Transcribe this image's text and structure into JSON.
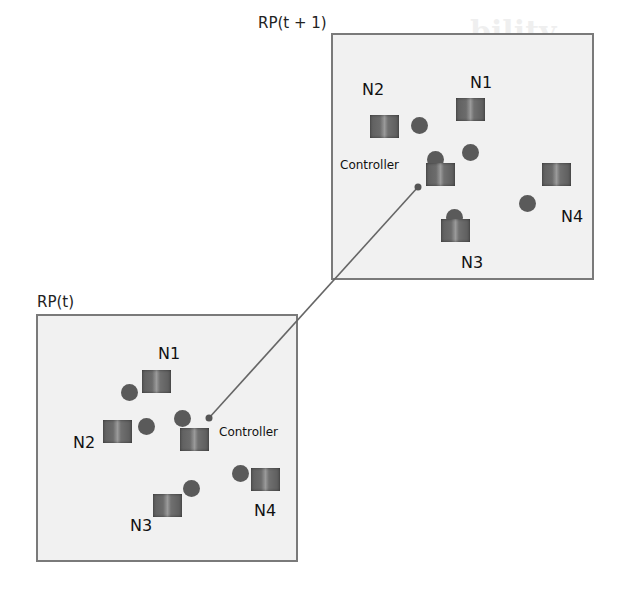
{
  "diagram": {
    "type": "network-topology-mobility",
    "regions": [
      {
        "id": "rp_t1",
        "label": "RP(t + 1)",
        "nodes": [
          {
            "label": "N1"
          },
          {
            "label": "N2"
          },
          {
            "label": "N3"
          },
          {
            "label": "N4"
          }
        ],
        "controller_label": "Controller"
      },
      {
        "id": "rp_t",
        "label": "RP(t)",
        "nodes": [
          {
            "label": "N1"
          },
          {
            "label": "N2"
          },
          {
            "label": "N3"
          },
          {
            "label": "N4"
          }
        ],
        "controller_label": "Controller"
      }
    ],
    "edges": [
      {
        "from": "rp_t.controller",
        "to": "rp_t1.controller"
      }
    ],
    "colors": {
      "region_fill": "#f1f1f1",
      "region_border": "#7a7a7a",
      "node_dot": "#5a5a5a",
      "link": "#666666"
    }
  }
}
